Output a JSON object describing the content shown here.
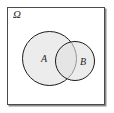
{
  "diagram": {
    "type": "venn-diagram",
    "title": "",
    "universe": {
      "symbol": "Ω",
      "name": "sample-space",
      "border_color": "#4a4a4a",
      "fill_color": "#ffffff",
      "shadow_color": "#8d8d8d"
    },
    "sets": [
      {
        "label": "A",
        "name": "set-a",
        "shape": "circle",
        "fill_color": "#e1e1e1",
        "stroke_color": "#1c1c1c",
        "center_x": 49.5,
        "center_y": 58.5,
        "radius": 27.5
      },
      {
        "label": "B",
        "name": "set-b",
        "shape": "circle",
        "fill_color": "#e1e1e1",
        "stroke_color": "#1c1c1c",
        "center_x": 75,
        "center_y": 61,
        "radius": 20
      }
    ],
    "relation": "overlapping",
    "background_color": "#ffffff"
  }
}
